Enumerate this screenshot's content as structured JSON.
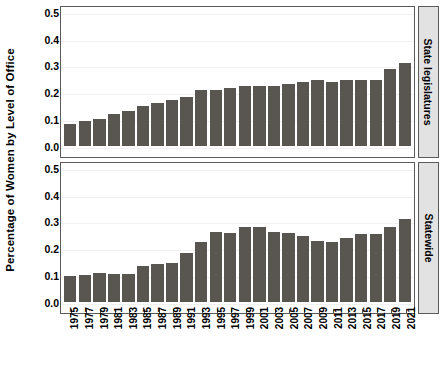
{
  "chart_data": {
    "type": "bar",
    "title": "",
    "xlabel": "",
    "ylabel": "Percentage of Women by Level of Office",
    "ylim": [
      0.0,
      0.5
    ],
    "yticks": [
      "0.0",
      "0.1",
      "0.2",
      "0.3",
      "0.4",
      "0.5"
    ],
    "ytick_values": [
      0.0,
      0.1,
      0.2,
      0.3,
      0.4,
      0.5
    ],
    "grid": true,
    "legend": "none",
    "layout": "two stacked panels with right-side strip labels",
    "bar_color": "#595651",
    "panel_strip_color": "#e2e2e2",
    "categories": [
      "1975",
      "1977",
      "1979",
      "1981",
      "1983",
      "1985",
      "1987",
      "1989",
      "1991",
      "1993",
      "1995",
      "1997",
      "1999",
      "2001",
      "2003",
      "2005",
      "2007",
      "2009",
      "2011",
      "2013",
      "2015",
      "2017",
      "2019",
      "2021"
    ],
    "panels": [
      {
        "strip_label": "State legislatures",
        "values": [
          0.08,
          0.091,
          0.101,
          0.118,
          0.128,
          0.148,
          0.159,
          0.17,
          0.18,
          0.207,
          0.207,
          0.217,
          0.223,
          0.224,
          0.224,
          0.229,
          0.237,
          0.245,
          0.238,
          0.245,
          0.245,
          0.246,
          0.288,
          0.31
        ]
      },
      {
        "strip_label": "Statewide",
        "values": [
          0.097,
          0.1,
          0.107,
          0.104,
          0.104,
          0.133,
          0.139,
          0.143,
          0.18,
          0.222,
          0.26,
          0.257,
          0.278,
          0.278,
          0.261,
          0.257,
          0.244,
          0.227,
          0.223,
          0.237,
          0.251,
          0.251,
          0.278,
          0.307
        ]
      }
    ]
  },
  "caption": ""
}
